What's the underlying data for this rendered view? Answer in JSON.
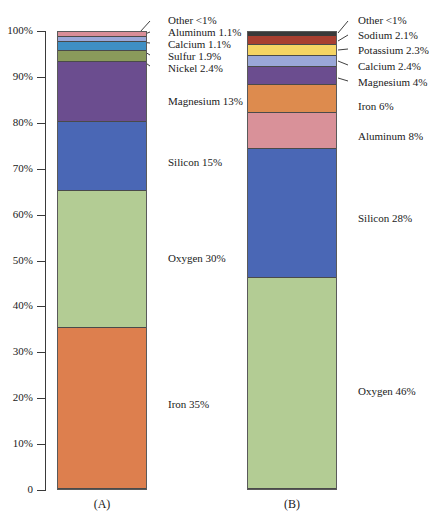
{
  "figure": {
    "background": "#ffffff",
    "axis_color": "#3a3a3a",
    "panel_a_label": "(A)",
    "panel_b_label": "(B)"
  },
  "axis": {
    "ticks": [
      "100%",
      "90%",
      "80%",
      "70%",
      "60%",
      "50%",
      "40%",
      "30%",
      "20%",
      "10%",
      "0"
    ],
    "tick_values": [
      100,
      90,
      80,
      70,
      60,
      50,
      40,
      30,
      20,
      10,
      0
    ]
  },
  "chart_data": {
    "type": "bar",
    "title": "",
    "xlabel": "",
    "ylabel": "",
    "ylim": [
      0,
      100
    ],
    "grid": false,
    "legend_position": "annotations-right",
    "stacked": true,
    "categories": [
      "(A)",
      "(B)"
    ],
    "charts": [
      {
        "name": "(A)",
        "panel": "A",
        "segments": [
          {
            "label": "Iron 35%",
            "element": "Iron",
            "value": 35,
            "color": "#dd7f4e"
          },
          {
            "label": "Oxygen 30%",
            "element": "Oxygen",
            "value": 30,
            "color": "#b3cc94"
          },
          {
            "label": "Silicon 15%",
            "element": "Silicon",
            "value": 15,
            "color": "#4a67b5"
          },
          {
            "label": "Magnesium 13%",
            "element": "Magnesium",
            "value": 13,
            "color": "#6b4d8f"
          },
          {
            "label": "Nickel 2.4%",
            "element": "Nickel",
            "value": 2.4,
            "color": "#8a9a5b"
          },
          {
            "label": "Sulfur 1.9%",
            "element": "Sulfur",
            "value": 1.9,
            "color": "#3f8fc4"
          },
          {
            "label": "Calcium 1.1%",
            "element": "Calcium",
            "value": 1.1,
            "color": "#9aa7d8"
          },
          {
            "label": "Aluminum 1.1%",
            "element": "Aluminum",
            "value": 1.1,
            "color": "#d98e98"
          },
          {
            "label": "Other <1%",
            "element": "Other",
            "value": 0.5,
            "color": "#3a3a3a"
          }
        ]
      },
      {
        "name": "(B)",
        "panel": "B",
        "segments": [
          {
            "label": "Oxygen 46%",
            "element": "Oxygen",
            "value": 46,
            "color": "#b3cc94"
          },
          {
            "label": "Silicon 28%",
            "element": "Silicon",
            "value": 28,
            "color": "#4a67b5"
          },
          {
            "label": "Aluminum 8%",
            "element": "Aluminum",
            "value": 8,
            "color": "#d99199"
          },
          {
            "label": "Iron 6%",
            "element": "Iron",
            "value": 6,
            "color": "#dd8b4e"
          },
          {
            "label": "Magnesium 4%",
            "element": "Magnesium",
            "value": 4,
            "color": "#6b4d8f"
          },
          {
            "label": "Calcium 2.4%",
            "element": "Calcium",
            "value": 2.4,
            "color": "#9aa7d8"
          },
          {
            "label": "Potassium 2.3%",
            "element": "Potassium",
            "value": 2.3,
            "color": "#f5d463"
          },
          {
            "label": "Sodium 2.1%",
            "element": "Sodium",
            "value": 2.1,
            "color": "#a83f30"
          },
          {
            "label": "Other <1%",
            "element": "Other",
            "value": 0.9,
            "color": "#3a3a3a"
          }
        ]
      }
    ]
  },
  "annotations": {
    "a": [
      {
        "text": "Other <1%",
        "x": 168,
        "y": 15,
        "leader": true,
        "lx1": 150,
        "ly1": 21,
        "lx2": 140,
        "ly2": 32
      },
      {
        "text": "Aluminum 1.1%",
        "x": 168,
        "y": 27,
        "leader": true,
        "lx1": 150,
        "ly1": 32,
        "lx2": 140,
        "ly2": 36
      },
      {
        "text": "Calcium 1.1%",
        "x": 168,
        "y": 39,
        "leader": true,
        "lx1": 150,
        "ly1": 43,
        "lx2": 140,
        "ly2": 42
      },
      {
        "text": "Sulfur 1.9%",
        "x": 168,
        "y": 51,
        "leader": true,
        "lx1": 150,
        "ly1": 55,
        "lx2": 140,
        "ly2": 49
      },
      {
        "text": "Nickel 2.4%",
        "x": 168,
        "y": 63,
        "leader": true,
        "lx1": 150,
        "ly1": 66,
        "lx2": 140,
        "ly2": 59
      },
      {
        "text": "Magnesium 13%",
        "x": 168,
        "y": 96,
        "leader": false
      },
      {
        "text": "Silicon 15%",
        "x": 168,
        "y": 157,
        "leader": false
      },
      {
        "text": "Oxygen 30%",
        "x": 168,
        "y": 253,
        "leader": false
      },
      {
        "text": "Iron 35%",
        "x": 168,
        "y": 399,
        "leader": false
      }
    ],
    "b": [
      {
        "text": "Other <1%",
        "x": 358,
        "y": 15,
        "leader": true,
        "lx1": 348,
        "ly1": 21,
        "lx2": 338,
        "ly2": 33
      },
      {
        "text": "Sodium 2.1%",
        "x": 358,
        "y": 30,
        "leader": true,
        "lx1": 348,
        "ly1": 35,
        "lx2": 338,
        "ly2": 41
      },
      {
        "text": "Potassium 2.3%",
        "x": 358,
        "y": 45,
        "leader": true,
        "lx1": 348,
        "ly1": 49,
        "lx2": 338,
        "ly2": 50
      },
      {
        "text": "Calcium 2.4%",
        "x": 358,
        "y": 61,
        "leader": true,
        "lx1": 348,
        "ly1": 65,
        "lx2": 338,
        "ly2": 61
      },
      {
        "text": "Magnesium 4%",
        "x": 358,
        "y": 77,
        "leader": true,
        "lx1": 348,
        "ly1": 81,
        "lx2": 338,
        "ly2": 78
      },
      {
        "text": "Iron 6%",
        "x": 358,
        "y": 101,
        "leader": false
      },
      {
        "text": "Aluminum 8%",
        "x": 358,
        "y": 131,
        "leader": false
      },
      {
        "text": "Silicon 28%",
        "x": 358,
        "y": 213,
        "leader": false
      },
      {
        "text": "Oxygen 46%",
        "x": 358,
        "y": 386,
        "leader": false
      }
    ]
  }
}
